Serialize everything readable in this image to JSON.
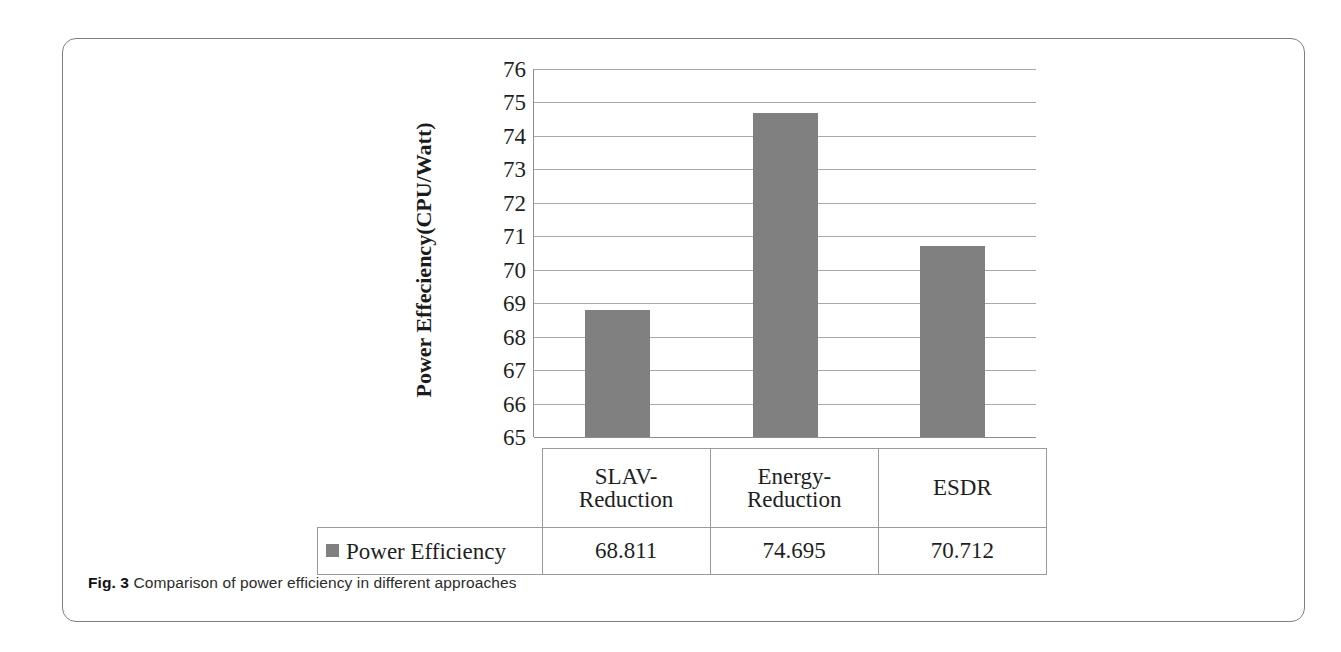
{
  "figure": {
    "label": "Fig. 3",
    "caption": "Comparison of power efficiency in different approaches"
  },
  "chart_data": {
    "type": "bar",
    "title": "",
    "xlabel": "",
    "ylabel": "Power Effeciency(CPU/Watt)",
    "categories": [
      "SLAV-Reduction",
      "Energy-Reduction",
      "ESDR"
    ],
    "category_lines": [
      [
        "SLAV-",
        "Reduction"
      ],
      [
        "Energy-",
        "Reduction"
      ],
      [
        "ESDR"
      ]
    ],
    "values": [
      68.811,
      74.695,
      70.712
    ],
    "value_labels": [
      "68.811",
      "74.695",
      "70.712"
    ],
    "series": [
      {
        "name": "Power Efficiency",
        "values": [
          68.811,
          74.695,
          70.712
        ]
      }
    ],
    "ylim": [
      65,
      76
    ],
    "ytick_labels": [
      "76",
      "75",
      "74",
      "73",
      "72",
      "71",
      "70",
      "69",
      "68",
      "67",
      "66",
      "65"
    ],
    "yticks": [
      76,
      75,
      74,
      73,
      72,
      71,
      70,
      69,
      68,
      67,
      66,
      65
    ],
    "grid": true,
    "legend": {
      "position": "bottom-table",
      "entries": [
        "Power Efficiency"
      ]
    },
    "colors": {
      "bar": "#808080",
      "gridline": "#a9a9a9",
      "axis": "#8d8d8d"
    }
  },
  "table": {
    "legend_label": "Power Efficiency"
  }
}
